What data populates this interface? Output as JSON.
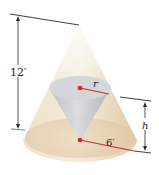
{
  "diagram": {
    "outer_cone": {
      "height_label": "12′",
      "radius_label": "6′",
      "fill": "#e9d7bc"
    },
    "inner_cone": {
      "radius_label": "r",
      "height_label": "h",
      "fill": "#c9ccd0"
    },
    "colors": {
      "radius_line": "#d9282b",
      "center_dot": "#e02020",
      "dimension_line": "#2a2a2a",
      "bottom_tick": "#5aa05a"
    }
  }
}
